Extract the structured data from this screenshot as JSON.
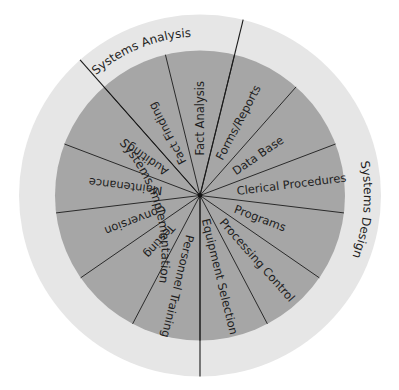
{
  "diagram": {
    "center": [
      200,
      195.5
    ],
    "outer_radius": 181,
    "inner_radius": 145,
    "colors": {
      "outer_ring": "#e6e6e6",
      "inner_disc": "#a6a6a6",
      "lines": "#222222",
      "text": "#1e1e1e",
      "background": "#ffffff"
    },
    "phases": [
      {
        "label": "Systems Analysis",
        "arc_start_deg": 131.5,
        "arc_end_deg": 76.2,
        "label_angle_deg": 112,
        "label_radius": 159
      },
      {
        "label": "Systems Design",
        "arc_start_deg": 76.2,
        "arc_end_deg": -90,
        "label_angle_deg": -5,
        "label_radius": 164
      },
      {
        "label": "Systems Implementation",
        "arc_start_deg": 270,
        "arc_end_deg": 131.5,
        "label_angle_deg": 196,
        "label_radius": 163
      }
    ],
    "phase_dividers_deg": [
      76.2,
      -90,
      131.5
    ],
    "spokes_deg": [
      -90,
      -62.3,
      -34.6,
      -6.9,
      20.8,
      48.5,
      76.2,
      103.8,
      131.5,
      159.2,
      186.9,
      214.6,
      242.3
    ],
    "segments": [
      {
        "label": "Fact Analysis",
        "phase": "Systems Analysis",
        "angle_deg": 90,
        "start_radius": 40
      },
      {
        "label": "Fact Finding",
        "phase": "Systems Analysis",
        "angle_deg": 117.7,
        "start_radius": 36
      },
      {
        "label": "Forms/Reports",
        "phase": "Systems Design",
        "angle_deg": 62.3,
        "start_radius": 41
      },
      {
        "label": "Data Base",
        "phase": "Systems Design",
        "angle_deg": 34.6,
        "start_radius": 41
      },
      {
        "label": "Clerical Procedures",
        "phase": "Systems Design",
        "angle_deg": 7,
        "start_radius": 37
      },
      {
        "label": "Programs",
        "phase": "Systems Design",
        "angle_deg": -20.8,
        "start_radius": 37
      },
      {
        "label": "Processing Control",
        "phase": "Systems Design",
        "angle_deg": -48.5,
        "start_radius": 33
      },
      {
        "label": "Equipment Selection",
        "phase": "Systems Design",
        "angle_deg": -76.2,
        "start_radius": 24
      },
      {
        "label": "Personnel Training",
        "phase": "Systems Implementation",
        "angle_deg": -103.8,
        "start_radius": 41
      },
      {
        "label": "Testing",
        "phase": "Systems Implementation",
        "angle_deg": -131.5,
        "start_radius": 41
      },
      {
        "label": "Conversion",
        "phase": "Systems Implementation",
        "angle_deg": -159.2,
        "start_radius": 37
      },
      {
        "label": "Maintenance",
        "phase": "Systems Implementation",
        "angle_deg": 173,
        "start_radius": 38
      },
      {
        "label": "Auditing",
        "phase": "Systems Implementation",
        "angle_deg": 145.4,
        "start_radius": 40
      }
    ]
  }
}
